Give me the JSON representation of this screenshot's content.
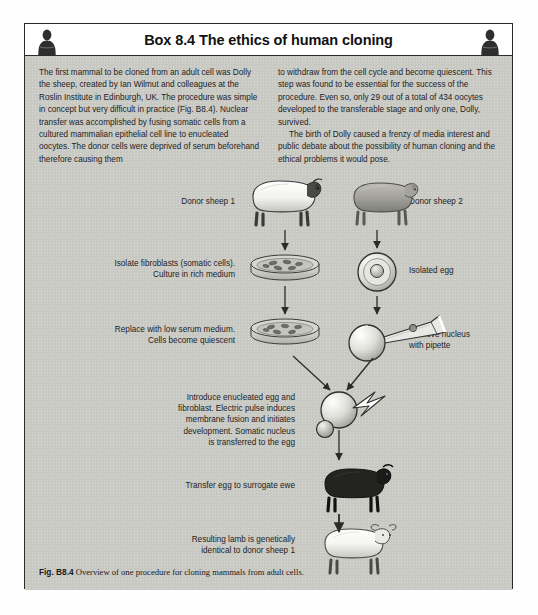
{
  "header": {
    "title": "Box 8.4 The ethics of human cloning",
    "icon_left": "person-silhouette-icon",
    "icon_right": "person-silhouette-icon"
  },
  "body_text": {
    "left_column": [
      "The first mammal to be cloned from an adult cell was Dolly the sheep, created by Ian Wilmut and colleagues at the Roslin Institute in Edinburgh, UK. The procedure was simple in concept but very difficult in practice (Fig. B8.4). Nuclear transfer was accomplished by fusing somatic cells from a cultured mammalian epithelial cell line to enucleated oocytes. The donor cells were deprived of serum beforehand therefore causing them"
    ],
    "right_column": [
      "to withdraw from the cell cycle and become quiescent. This step was found to be essential for the success of the procedure. Even so, only 29 out of a total of 434 oocytes developed to the transferable stage and only one, Dolly, survived.",
      "The birth of Dolly caused a frenzy of media interest and public debate about the possibility of human cloning and the ethical problems it would pose."
    ]
  },
  "diagram": {
    "labels": {
      "donor_sheep_1": "Donor sheep 1",
      "isolate_fibroblasts": "Isolate fibroblasts (somatic cells).\nCulture in rich medium",
      "replace_low_serum": "Replace with low serum medium.\nCells become quiescent",
      "introduce_enucleated": "Introduce enucleated egg and\nfibroblast. Electric pulse induces\nmembrane fusion and initiates\ndevelopment. Somatic nucleus\nis transferred to the egg",
      "transfer_egg": "Transfer egg to surrogate ewe",
      "resulting_lamb": "Resulting lamb is genetically\nidentical to donor sheep 1",
      "donor_sheep_2": "Donor sheep 2",
      "isolated_egg": "Isolated egg",
      "remove_nucleus": "Remove nucleus\nwith pipette"
    },
    "figures": {
      "sheep_white": "white-sheep-icon",
      "sheep_grey": "grey-sheep-icon",
      "sheep_black": "black-sheep-icon",
      "lamb_white": "white-lamb-icon",
      "petri_dish_rich": "petri-dish-icon",
      "petri_dish_low_serum": "petri-dish-icon",
      "egg_cell": "egg-cell-icon",
      "enucleated_egg": "enucleated-egg-icon",
      "pipette": "pipette-icon",
      "fused_cell": "fused-cell-icon",
      "lightning": "electric-pulse-icon"
    }
  },
  "caption": {
    "label": "Fig. B8.4",
    "text": "Overview of one procedure for cloning mammals from adult cells."
  },
  "colors": {
    "box_background": "#c9c9c4",
    "header_background": "#ffffff",
    "border": "#2b2b2b",
    "text": "#1d1d1d"
  }
}
